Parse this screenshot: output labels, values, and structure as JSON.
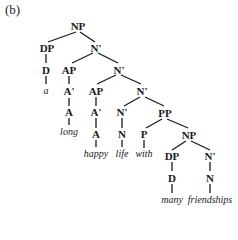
{
  "figure_label": "(b)",
  "nodes": {
    "np_root": "NP",
    "dp1": "DP",
    "nbar1": "N'",
    "d1": "D",
    "ap1": "AP",
    "nbar2": "N'",
    "abar1": "A'",
    "a1": "A",
    "ap2": "AP",
    "nbar3": "N'",
    "abar2": "A'",
    "a2": "A",
    "nbar4": "N'",
    "n1": "N",
    "pp": "PP",
    "p": "P",
    "np2": "NP",
    "dp2": "DP",
    "d2": "D",
    "nbar5": "N'",
    "n2": "N"
  },
  "words": {
    "a": "a",
    "long": "long",
    "happy": "happy",
    "life": "life",
    "with": "with",
    "many": "many",
    "friendships": "friendships"
  }
}
